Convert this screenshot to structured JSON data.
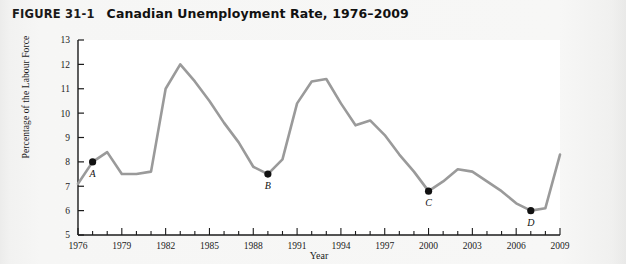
{
  "figure": {
    "label": "FIGURE 31-1",
    "title": "Canadian Unemployment Rate, 1976–2009"
  },
  "chart_data": {
    "type": "line",
    "title": "Canadian Unemployment Rate, 1976–2009",
    "xlabel": "Year",
    "ylabel": "Percentage of the Labour Force",
    "xlim": [
      1976,
      2009
    ],
    "ylim": [
      5,
      13
    ],
    "ytick_step": 1,
    "yticks": [
      5,
      6,
      7,
      8,
      9,
      10,
      11,
      12,
      13
    ],
    "ytick_labels": [
      "5",
      "6",
      "7",
      "8",
      "9",
      "10",
      "11",
      "12",
      "13"
    ],
    "xticks": [
      1976,
      1979,
      1982,
      1985,
      1988,
      1991,
      1994,
      1997,
      2000,
      2003,
      2006,
      2009
    ],
    "xtick_labels": [
      "1976",
      "1979",
      "1982",
      "1985",
      "1988",
      "1991",
      "1994",
      "1997",
      "2000",
      "2003",
      "2006",
      "2009"
    ],
    "x_minor_tick_step": 1,
    "grid": false,
    "legend": null,
    "line_color": "#9a9a9a",
    "line_width": 2.6,
    "marker_color": "#111111",
    "x": [
      1976,
      1977,
      1978,
      1979,
      1980,
      1981,
      1982,
      1983,
      1984,
      1985,
      1986,
      1987,
      1988,
      1989,
      1990,
      1991,
      1992,
      1993,
      1994,
      1995,
      1996,
      1997,
      1998,
      1999,
      2000,
      2001,
      2002,
      2003,
      2004,
      2005,
      2006,
      2007,
      2008,
      2009
    ],
    "values": [
      7.1,
      8.0,
      8.4,
      7.5,
      7.5,
      7.6,
      11.0,
      12.0,
      11.3,
      10.5,
      9.6,
      8.8,
      7.8,
      7.5,
      8.1,
      10.4,
      11.3,
      11.4,
      10.4,
      9.5,
      9.7,
      9.1,
      8.3,
      7.6,
      6.8,
      7.2,
      7.7,
      7.6,
      7.2,
      6.8,
      6.3,
      6.0,
      6.1,
      8.3
    ],
    "annotations": [
      {
        "label": "A",
        "x": 1977,
        "y": 8.0
      },
      {
        "label": "B",
        "x": 1989,
        "y": 7.5
      },
      {
        "label": "C",
        "x": 2000,
        "y": 6.8
      },
      {
        "label": "D",
        "x": 2007,
        "y": 6.0
      }
    ]
  }
}
